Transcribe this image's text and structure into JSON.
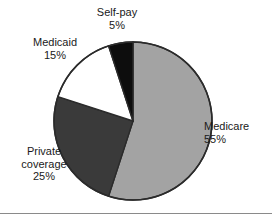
{
  "chart_data": {
    "type": "pie",
    "title": "",
    "subtitle": "",
    "xlabel": "",
    "ylabel": "",
    "legend_position": "none",
    "grid": false,
    "units": "percent",
    "start_angle_deg": 0,
    "direction": "clockwise",
    "categories": [
      "Medicare",
      "Private coverage",
      "Medicaid",
      "Self-pay"
    ],
    "values": [
      55,
      25,
      15,
      5
    ],
    "slices": [
      {
        "name": "Medicare",
        "label_line1": "Medicare",
        "label_line2": "55%",
        "value": 55,
        "value_text": "55%",
        "color": "#a3a3a3",
        "start_deg": 0,
        "end_deg": 198,
        "label_position": "right"
      },
      {
        "name": "Private coverage",
        "label_line1": "Private",
        "label_line2": "coverage",
        "label_line3": "25%",
        "value": 25,
        "value_text": "25%",
        "color": "#3a3a3a",
        "start_deg": 198,
        "end_deg": 288,
        "label_position": "lower-left"
      },
      {
        "name": "Medicaid",
        "label_line1": "Medicaid",
        "label_line2": "15%",
        "value": 15,
        "value_text": "15%",
        "color": "#ffffff",
        "start_deg": 288,
        "end_deg": 342,
        "label_position": "upper-left"
      },
      {
        "name": "Self-pay",
        "label_line1": "Self-pay",
        "label_line2": "5%",
        "value": 5,
        "value_text": "5%",
        "color": "#0d0d0d",
        "start_deg": 342,
        "end_deg": 360,
        "label_position": "top"
      }
    ],
    "colors": {
      "medicare": "#a3a3a3",
      "private_coverage": "#3a3a3a",
      "medicaid": "#ffffff",
      "self_pay": "#0d0d0d",
      "outline": "#2b2b2b",
      "background": "#ffffff",
      "text": "#1a1a1a",
      "rule": "#8a8a8a"
    }
  }
}
